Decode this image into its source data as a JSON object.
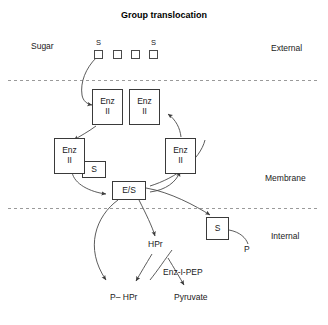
{
  "diagram": {
    "title": "Group translocation",
    "zones": [
      {
        "name": "external",
        "label": "External"
      },
      {
        "name": "membrane",
        "label": "Membrane"
      },
      {
        "name": "internal",
        "label": "Internal"
      }
    ],
    "sugar_label": "Sugar",
    "sugar_units": [
      {
        "box": "",
        "mark": "S"
      },
      {
        "box": "",
        "mark": ""
      },
      {
        "box": "",
        "mark": ""
      },
      {
        "box": "",
        "mark": "S"
      }
    ],
    "enzyme_cycle": [
      {
        "id": "enz-ii-top-left",
        "line1": "Enz",
        "line2": "II"
      },
      {
        "id": "enz-ii-top-right",
        "line1": "Enz",
        "line2": "II"
      },
      {
        "id": "enz-ii-left",
        "line1": "Enz",
        "line2": "II"
      },
      {
        "id": "enz-ii-right",
        "line1": "Enz",
        "line2": "II"
      }
    ],
    "bound_sugar_label": "S",
    "complex_label": "E/S",
    "internal_sugar_label": "S",
    "phosphate_label": "P",
    "hpr_label": "HPr",
    "phospho_hpr_label": "P– HPr",
    "enz_i_pep_label": "Enz-I-PEP",
    "pyruvate_label": "Pyruvate",
    "colors": {
      "stroke": "#4a4a4a",
      "box_border": "#3a3a3a",
      "membrane_line": "#8a8a8a",
      "text": "#1a1a1a",
      "background": "#ffffff"
    }
  }
}
